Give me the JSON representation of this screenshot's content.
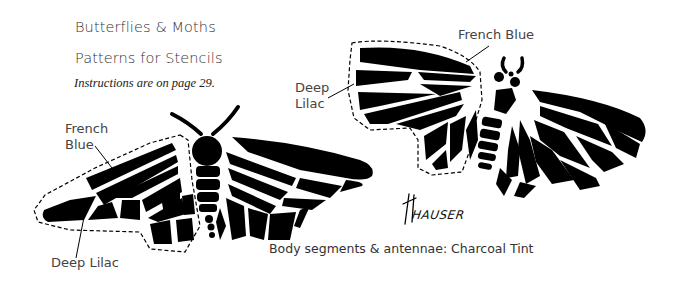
{
  "page": {
    "title": "Butterflies & Moths",
    "subtitle": "Patterns for Stencils",
    "instructions": "Instructions are on page 29."
  },
  "moth_left": {
    "labels": {
      "french_blue_line1": "French",
      "french_blue_line2": "Blue",
      "deep_lilac": "Deep Lilac"
    }
  },
  "moth_right": {
    "labels": {
      "french_blue": "French Blue",
      "deep_lilac_line1": "Deep",
      "deep_lilac_line2": "Lilac"
    }
  },
  "signature": "HAUSER",
  "caption": "Body segments & antennae: Charcoal Tint",
  "colors": {
    "ink": "#000000",
    "text": "#3a3a3a",
    "background": "#ffffff"
  }
}
